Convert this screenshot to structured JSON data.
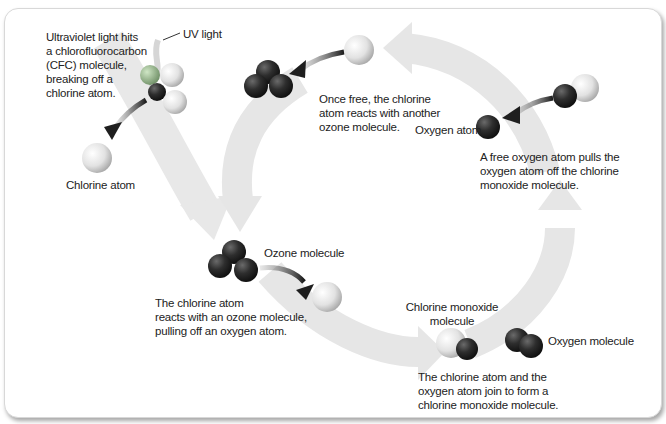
{
  "diagram": {
    "labels": {
      "cfc_step": [
        "Ultraviolet light hits",
        "a chlorofluorocarbon",
        "(CFC) molecule,",
        "breaking off a",
        "chlorine atom."
      ],
      "uv_light": "UV light",
      "chlorine_atom": "Chlorine atom",
      "once_free": [
        "Once free, the chlorine",
        "atom reacts with another",
        "ozone molecule."
      ],
      "oxygen_atom": "Oxygen atom",
      "free_oxygen": [
        "A free oxygen atom pulls the",
        "oxygen atom off the chlorine",
        "monoxide molecule."
      ],
      "ozone_molecule": "Ozone molecule",
      "chlorine_reacts": [
        "The chlorine atom",
        "reacts with an ozone molecule,",
        "pulling off an oxygen atom."
      ],
      "chlorine_monoxide": [
        "Chlorine monoxide",
        "molecule"
      ],
      "oxygen_molecule": "Oxygen molecule",
      "join": [
        "The chlorine atom and the",
        "oxygen atom join to form a",
        "chlorine monoxide molecule."
      ]
    },
    "colors": {
      "cycle_arrow": "#e6e6e6",
      "oxygen_atom": "#2b2b2b",
      "chlorine_atom": "#e9e9e9",
      "reaction_arrow": "#2a2a2a"
    }
  }
}
